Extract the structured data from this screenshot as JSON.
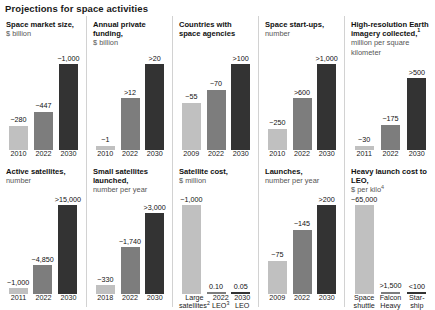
{
  "title": "Projections for space activities",
  "colors": {
    "light": "#c0c0c0",
    "mid": "#7d7d7d",
    "dark": "#333333"
  },
  "chart_data": [
    {
      "type": "bar",
      "title": "Space market size,",
      "subtitle": "$ billion",
      "categories": [
        "2010",
        "2022",
        "2030"
      ],
      "values": [
        280,
        447,
        1000
      ],
      "labels": [
        "~280",
        "~447",
        "~1,000"
      ],
      "ylim": [
        0,
        1000
      ]
    },
    {
      "type": "bar",
      "title": "Annual private funding,",
      "subtitle": "$ billion",
      "categories": [
        "2010",
        "2022",
        "2030"
      ],
      "values": [
        1,
        12,
        20
      ],
      "labels": [
        "~1",
        ">12",
        ">20"
      ],
      "ylim": [
        0,
        20
      ]
    },
    {
      "type": "bar",
      "title": "Countries with space agencies",
      "subtitle": "",
      "categories": [
        "2009",
        "2022",
        "2030"
      ],
      "values": [
        55,
        70,
        100
      ],
      "labels": [
        "~55",
        "~70",
        ">100"
      ],
      "ylim": [
        0,
        100
      ]
    },
    {
      "type": "bar",
      "title": "Space start-ups,",
      "subtitle": "number",
      "categories": [
        "2010",
        "2022",
        "2030"
      ],
      "values": [
        250,
        600,
        1000
      ],
      "labels": [
        "~250",
        ">600",
        ">1,000"
      ],
      "ylim": [
        0,
        1000
      ]
    },
    {
      "type": "bar",
      "title": "High-resolution Earth imagery collected,",
      "title_footnote": "1",
      "subtitle": "million per square kilometer",
      "categories": [
        "2011",
        "2022",
        "2030"
      ],
      "values": [
        30,
        175,
        500
      ],
      "labels": [
        "~30",
        "~175",
        ">500"
      ],
      "ylim": [
        0,
        500
      ]
    },
    {
      "type": "bar",
      "title": "Active satellites,",
      "subtitle": "number",
      "categories": [
        "2011",
        "2022",
        "2030"
      ],
      "values": [
        1000,
        4850,
        15000
      ],
      "labels": [
        "~1,000",
        "~4,850",
        ">15,000"
      ],
      "ylim": [
        0,
        15000
      ]
    },
    {
      "type": "bar",
      "title": "Small satellites launched,",
      "subtitle": "number per year",
      "categories": [
        "2018",
        "2022",
        "2030"
      ],
      "values": [
        330,
        1740,
        3000
      ],
      "labels": [
        "~330",
        "~1,740",
        ">3,000"
      ],
      "ylim": [
        0,
        3000
      ]
    },
    {
      "type": "bar",
      "title": "Satellite cost,",
      "subtitle": "$ million",
      "categories": [
        "Large\nsatellites",
        "2022\nLEO",
        "2030\nLEO"
      ],
      "category_footnotes": [
        "2",
        "3",
        ""
      ],
      "values": [
        1000,
        0.1,
        0.05
      ],
      "labels": [
        "~1,000",
        "0.10",
        "0.05"
      ],
      "ylim": [
        0,
        1000
      ]
    },
    {
      "type": "bar",
      "title": "Launches,",
      "subtitle": "number per year",
      "categories": [
        "2009",
        "2022",
        "2030"
      ],
      "values": [
        75,
        145,
        200
      ],
      "labels": [
        "~75",
        "~145",
        ">200"
      ],
      "ylim": [
        0,
        200
      ]
    },
    {
      "type": "bar",
      "title": "Heavy launch cost to LEO,",
      "subtitle": "$ per kilo",
      "subtitle_footnote": "4",
      "categories": [
        "Space\nshuttle",
        "Falcon\nHeavy",
        "Star-\nship"
      ],
      "values": [
        65000,
        1500,
        100
      ],
      "labels": [
        "~65,000",
        ">1,500",
        "<100"
      ],
      "ylim": [
        0,
        65000
      ]
    }
  ]
}
